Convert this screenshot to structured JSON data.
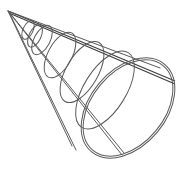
{
  "figure": {
    "title": "Wireframe cone",
    "colors": {
      "background": "#ffffff",
      "stroke": "#5a5a5a",
      "stroke_dark": "#3c3c3c"
    },
    "apex": [
      8,
      11
    ],
    "rings": [
      {
        "cx": 44,
        "cy": 42,
        "rx": 9,
        "ry": 15,
        "rotate": 30
      },
      {
        "cx": 62,
        "cy": 58,
        "rx": 13,
        "ry": 24,
        "rotate": 30
      },
      {
        "cx": 84,
        "cy": 74,
        "rx": 17,
        "ry": 33,
        "rotate": 30
      },
      {
        "cx": 108,
        "cy": 92,
        "rx": 22,
        "ry": 43,
        "rotate": 30
      },
      {
        "cx": 130,
        "cy": 108,
        "rx": 36,
        "ry": 55,
        "rotate": 38
      }
    ]
  }
}
